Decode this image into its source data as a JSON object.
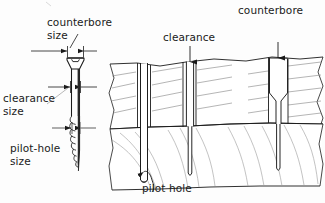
{
  "figure": {
    "type": "technical-illustration",
    "background_color": "#fdfdfd",
    "ink_color": "#1a1a1a",
    "grain_color": "#8d8d8d"
  },
  "labels": {
    "counterbore_size": "counterbore\nsize",
    "clearance_size": "clearance\nsize",
    "pilot_hole_size": "pilot-hole\nsize",
    "clearance": "clearance",
    "counterbore": "counterbore",
    "pilot_hole": "pilot hole"
  },
  "left_panel": {
    "name": "screw-dimension-diagram",
    "description": "Flat-head countersunk wood screw shown in elevation with three width dimensions called out",
    "dimensions": [
      {
        "name": "counterbore-size",
        "label": "counterbore size",
        "measures": "screw head diameter"
      },
      {
        "name": "clearance-size",
        "label": "clearance size",
        "measures": "screw shank diameter"
      },
      {
        "name": "pilot-hole-size",
        "label": "pilot-hole size",
        "measures": "screw thread root diameter"
      }
    ]
  },
  "right_panel": {
    "name": "board-cross-sections",
    "description": "Two stacked boards in section showing three drilling treatments",
    "boards": [
      {
        "name": "upper-board",
        "label": "upper board"
      },
      {
        "name": "lower-board",
        "label": "lower board"
      }
    ],
    "sections": [
      {
        "name": "pilot-only-section",
        "label": "pilot hole only",
        "callout": "pilot hole",
        "holes": [
          "pilot hole through both boards"
        ]
      },
      {
        "name": "clearance-section",
        "label": "clearance hole",
        "callout": "clearance",
        "holes": [
          "clearance hole in upper board",
          "pilot hole in lower board"
        ]
      },
      {
        "name": "counterbore-section",
        "label": "counterbored hole",
        "callout": "counterbore",
        "holes": [
          "counterbore at top",
          "clearance hole below",
          "pilot hole in lower board"
        ]
      }
    ]
  }
}
